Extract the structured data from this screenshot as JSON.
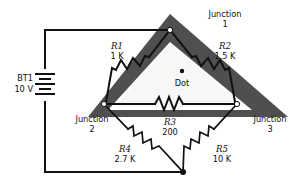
{
  "figure": {
    "type": "schematic-diagram",
    "title_visible": false,
    "background_color": "#ffffff",
    "band_color": "#4f4f4f",
    "wire_color": "#111111"
  },
  "source": {
    "label": "BT1",
    "value": "10 V",
    "symbol": "battery-multicell"
  },
  "center_marker": {
    "label": "Dot",
    "symbol": "filled-dot"
  },
  "junctions": [
    {
      "id": "j1",
      "name": "Junction",
      "number": "1",
      "node_style": "open"
    },
    {
      "id": "j2",
      "name": "Junction",
      "number": "2",
      "node_style": "open"
    },
    {
      "id": "j3",
      "name": "Junction",
      "number": "3",
      "node_style": "open"
    },
    {
      "id": "j4",
      "name": "",
      "number": "",
      "node_style": "solid"
    }
  ],
  "resistors": [
    {
      "id": "R1",
      "ref": "R1",
      "value": "1 K"
    },
    {
      "id": "R2",
      "ref": "R2",
      "value": "1.5 K"
    },
    {
      "id": "R3",
      "ref": "R3",
      "value": "200"
    },
    {
      "id": "R4",
      "ref": "R4",
      "value": "2.7 K"
    },
    {
      "id": "R5",
      "ref": "R5",
      "value": "10 K"
    }
  ]
}
